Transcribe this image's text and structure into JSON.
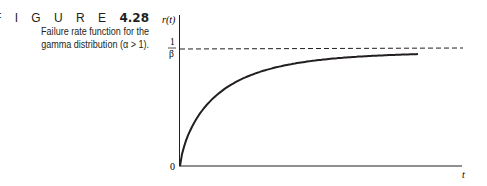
{
  "figure": {
    "label": "F I G U R E",
    "number": "4.28",
    "caption_line1": "Failure rate function for the",
    "caption_line2": "gamma distribution (α > 1)."
  },
  "chart_data": {
    "type": "line",
    "title": "Failure rate function for the gamma distribution (α > 1)",
    "xlabel": "t",
    "ylabel": "r(t)",
    "y_tick_labels": [
      "0",
      "1/β"
    ],
    "asymptote": {
      "label": "1/β",
      "style": "dashed",
      "y": 1
    },
    "series": [
      {
        "name": "r(t)",
        "x": [
          0,
          0.05,
          0.1,
          0.2,
          0.3,
          0.4,
          0.5,
          0.6,
          0.7,
          0.8,
          0.9,
          1.0
        ],
        "values": [
          0,
          0.4,
          0.55,
          0.7,
          0.79,
          0.85,
          0.89,
          0.92,
          0.94,
          0.955,
          0.965,
          0.97
        ]
      }
    ],
    "ylim": [
      0,
      1.3
    ],
    "xlim": [
      0,
      1.2
    ],
    "grid": false
  },
  "axis": {
    "y_label": "r(t)",
    "x_label": "t",
    "origin": "0",
    "asym_num": "1",
    "asym_den": "β"
  }
}
